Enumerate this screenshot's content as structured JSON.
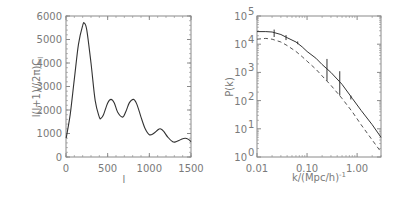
{
  "chart_data": [
    {
      "type": "line",
      "title": "",
      "xlabel": "l",
      "ylabel": "l(l+1)/(2π)C_l",
      "xlim": [
        0,
        1500
      ],
      "ylim": [
        0,
        6000
      ],
      "xticks": [
        "0",
        "500",
        "1000",
        "1500"
      ],
      "yticks": [
        "0",
        "1000",
        "2000",
        "3000",
        "4000",
        "5000",
        "6000"
      ],
      "grid": false,
      "series": [
        {
          "name": "CMB temperature power spectrum",
          "style": "solid",
          "x": [
            2,
            50,
            100,
            150,
            200,
            220,
            250,
            300,
            350,
            400,
            420,
            450,
            500,
            540,
            580,
            620,
            680,
            720,
            760,
            810,
            850,
            900,
            950,
            1000,
            1050,
            1100,
            1130,
            1170,
            1220,
            1280,
            1320,
            1380,
            1430,
            1470,
            1500
          ],
          "y": [
            800,
            1800,
            3300,
            4800,
            5600,
            5700,
            5400,
            4000,
            2400,
            1700,
            1650,
            1800,
            2300,
            2450,
            2300,
            1900,
            1700,
            1950,
            2300,
            2450,
            2250,
            1700,
            1200,
            950,
            1000,
            1150,
            1200,
            1100,
            850,
            650,
            650,
            750,
            800,
            750,
            650
          ]
        }
      ]
    },
    {
      "type": "line",
      "title": "",
      "xlabel": "k/(Mpc/h)^-1",
      "ylabel": "P(k)",
      "xscale": "log",
      "yscale": "log",
      "xlim": [
        0.01,
        3.0
      ],
      "ylim": [
        1,
        100000
      ],
      "xticks": [
        "0.01",
        "0.10",
        "1.00"
      ],
      "yticks": [
        "10^0",
        "10^1",
        "10^2",
        "10^3",
        "10^4",
        "10^5"
      ],
      "grid": false,
      "series": [
        {
          "name": "model (solid)",
          "style": "solid",
          "x": [
            0.01,
            0.015,
            0.02,
            0.03,
            0.04,
            0.06,
            0.08,
            0.1,
            0.15,
            0.2,
            0.3,
            0.5,
            0.8,
            1.2,
            2.0,
            3.0
          ],
          "y": [
            28000,
            28000,
            27000,
            22000,
            17000,
            12000,
            8000,
            5500,
            3200,
            1900,
            1000,
            380,
            120,
            45,
            14,
            5
          ]
        },
        {
          "name": "model (dashed)",
          "style": "dashed",
          "x": [
            0.01,
            0.015,
            0.02,
            0.03,
            0.04,
            0.06,
            0.08,
            0.1,
            0.15,
            0.2,
            0.3,
            0.5,
            0.8,
            1.2,
            2.0,
            3.0
          ],
          "y": [
            15000,
            16000,
            15000,
            12000,
            9000,
            5500,
            3600,
            2500,
            1300,
            750,
            350,
            120,
            40,
            14,
            4,
            1.5
          ]
        },
        {
          "name": "data with error bars",
          "style": "errorbar",
          "x": [
            0.022,
            0.038,
            0.065,
            0.25,
            0.45,
            0.75
          ],
          "y": [
            25000,
            17000,
            11000,
            1100,
            400,
            130
          ],
          "yerr_low": [
            18000,
            14000,
            10000,
            500,
            150,
            110
          ],
          "yerr_high": [
            33000,
            21000,
            12500,
            3000,
            1100,
            150
          ]
        }
      ]
    }
  ],
  "labels": {
    "left_ylabel": "l(l+1)/(2π)C",
    "left_ylabel_sub": "l",
    "left_xlabel": "l",
    "right_ylabel": "P(k)",
    "right_xlabel": "k/(Mpc/h)",
    "right_xlabel_sup": "-1"
  }
}
